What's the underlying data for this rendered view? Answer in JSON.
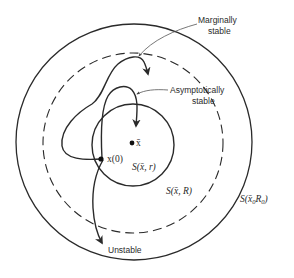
{
  "diagram": {
    "type": "stability-regions",
    "regions": {
      "inner": {
        "label": "S(x̄, r)",
        "style": "solid"
      },
      "middle": {
        "label": "S(x̄, R)",
        "style": "dashed"
      },
      "outer": {
        "label_prefix": "S(x̄",
        "label_sub1": "0",
        "label_mid": "R",
        "label_sub2": "0",
        "label_suffix": ")",
        "style": "solid"
      }
    },
    "points": {
      "equilibrium": {
        "label": "x̄"
      },
      "initial": {
        "label": "x(0)"
      }
    },
    "trajectories": [
      {
        "name": "marginally-stable",
        "label_line1": "Marginally",
        "label_line2": "stable"
      },
      {
        "name": "asymptotically-stable",
        "label_line1": "Asymptotically",
        "label_line2": "stable"
      },
      {
        "name": "unstable",
        "label_line1": "Unstable"
      }
    ],
    "colors": {
      "ink": "#2a2a2a",
      "background": "#ffffff"
    }
  }
}
